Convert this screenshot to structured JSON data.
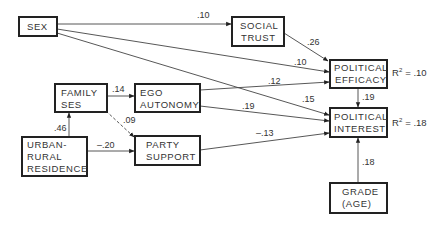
{
  "nodes": {
    "sex": {
      "lines": [
        "SEX"
      ]
    },
    "social_trust": {
      "lines": [
        "SOCIAL",
        "TRUST"
      ]
    },
    "political_efficacy": {
      "lines": [
        "POLITICAL",
        "EFFICACY"
      ],
      "r2_label": "R",
      "r2_value": "= .10"
    },
    "political_interest": {
      "lines": [
        "POLITICAL",
        "INTEREST"
      ],
      "r2_label": "R",
      "r2_value": "= .18"
    },
    "family_ses": {
      "lines": [
        "FAMILY",
        "SES"
      ]
    },
    "ego_autonomy": {
      "lines": [
        "EGO",
        "AUTONOMY"
      ]
    },
    "urban_rural": {
      "lines": [
        "URBAN-",
        "RURAL",
        "RESIDENCE"
      ]
    },
    "party_support": {
      "lines": [
        "PARTY",
        "SUPPORT"
      ]
    },
    "grade_age": {
      "lines": [
        "GRADE",
        "(AGE)"
      ]
    }
  },
  "r2_superscript": "2",
  "edges": {
    "sex_social_trust": ".10",
    "sex_efficacy": ".10",
    "sex_interest": ".15",
    "social_trust_efficacy": ".26",
    "family_ego": ".14",
    "family_party": ".09",
    "ego_efficacy": ".12",
    "ego_interest": ".19",
    "urban_family": ".46",
    "urban_party": "–.20",
    "party_interest": "–.13",
    "efficacy_interest": ".19",
    "grade_interest": ".18"
  }
}
